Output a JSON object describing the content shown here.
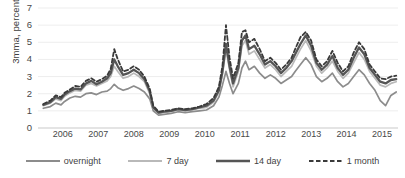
{
  "chart_data": {
    "type": "line",
    "title": "",
    "xlabel": "",
    "ylabel": "3mma, percent",
    "ylim": [
      0,
      7
    ],
    "yticks": [
      0,
      1,
      2,
      3,
      4,
      5,
      6,
      7
    ],
    "xlim": [
      2005.75,
      2015.9
    ],
    "xticks": [
      2006,
      2007,
      2008,
      2009,
      2010,
      2011,
      2012,
      2013,
      2014,
      2015
    ],
    "xtick_labels": [
      "2006",
      "2007",
      "2008",
      "2009",
      "2010",
      "2011",
      "2012",
      "2013",
      "2014",
      "2015"
    ],
    "grid": "horizontal-light",
    "legend_position": "bottom",
    "series": [
      {
        "name": "overnight",
        "color": "#8c8c8c",
        "width": 1.7,
        "dash": "none",
        "x": [
          2005.9,
          2006.1,
          2006.25,
          2006.4,
          2006.5,
          2006.65,
          2006.8,
          2006.95,
          2007.1,
          2007.25,
          2007.4,
          2007.55,
          2007.7,
          2007.8,
          2007.9,
          2008.0,
          2008.15,
          2008.3,
          2008.45,
          2008.6,
          2008.75,
          2008.9,
          2009.0,
          2009.15,
          2009.3,
          2009.5,
          2009.7,
          2009.9,
          2010.1,
          2010.3,
          2010.5,
          2010.7,
          2010.85,
          2010.95,
          2011.05,
          2011.15,
          2011.25,
          2011.4,
          2011.5,
          2011.6,
          2011.7,
          2011.85,
          2012.0,
          2012.15,
          2012.3,
          2012.45,
          2012.6,
          2012.75,
          2012.9,
          2013.0,
          2013.15,
          2013.3,
          2013.45,
          2013.6,
          2013.75,
          2013.9,
          2014.05,
          2014.2,
          2014.35,
          2014.5,
          2014.65,
          2014.8,
          2014.95,
          2015.1,
          2015.25,
          2015.4,
          2015.55,
          2015.7,
          2015.85
        ],
        "values": [
          1.15,
          1.25,
          1.45,
          1.35,
          1.55,
          1.75,
          1.85,
          1.8,
          2.0,
          2.05,
          1.95,
          2.1,
          2.15,
          2.3,
          2.55,
          2.35,
          2.2,
          2.3,
          2.45,
          2.3,
          2.1,
          1.7,
          1.0,
          0.75,
          0.8,
          0.85,
          0.95,
          0.9,
          0.95,
          1.0,
          1.05,
          1.3,
          1.8,
          2.5,
          3.3,
          2.6,
          2.0,
          2.6,
          3.5,
          3.9,
          3.4,
          3.6,
          3.2,
          2.9,
          3.1,
          2.9,
          2.6,
          2.8,
          3.0,
          3.3,
          3.7,
          4.1,
          3.7,
          3.0,
          2.7,
          2.9,
          3.2,
          2.7,
          2.4,
          2.6,
          3.0,
          3.4,
          3.1,
          2.6,
          2.2,
          1.6,
          1.3,
          1.9,
          2.1
        ]
      },
      {
        "name": "7 day",
        "color": "#b9b9b9",
        "width": 1.7,
        "dash": "none",
        "x": [
          2005.9,
          2006.1,
          2006.25,
          2006.4,
          2006.5,
          2006.65,
          2006.8,
          2006.95,
          2007.1,
          2007.25,
          2007.4,
          2007.55,
          2007.7,
          2007.8,
          2007.9,
          2008.0,
          2008.15,
          2008.3,
          2008.45,
          2008.6,
          2008.75,
          2008.9,
          2009.0,
          2009.15,
          2009.3,
          2009.5,
          2009.7,
          2009.9,
          2010.1,
          2010.3,
          2010.5,
          2010.7,
          2010.85,
          2010.95,
          2011.05,
          2011.15,
          2011.25,
          2011.4,
          2011.5,
          2011.6,
          2011.7,
          2011.85,
          2012.0,
          2012.15,
          2012.3,
          2012.45,
          2012.6,
          2012.75,
          2012.9,
          2013.0,
          2013.15,
          2013.3,
          2013.45,
          2013.6,
          2013.75,
          2013.9,
          2014.05,
          2014.2,
          2014.35,
          2014.5,
          2014.65,
          2014.8,
          2014.95,
          2015.1,
          2015.25,
          2015.4,
          2015.55,
          2015.7,
          2015.85
        ],
        "values": [
          1.3,
          1.45,
          1.7,
          1.6,
          1.85,
          2.05,
          2.2,
          2.15,
          2.5,
          2.6,
          2.45,
          2.6,
          2.75,
          3.0,
          3.6,
          3.3,
          2.9,
          3.0,
          3.2,
          3.0,
          2.7,
          2.0,
          1.15,
          0.85,
          0.9,
          0.95,
          1.05,
          1.0,
          1.05,
          1.15,
          1.2,
          1.5,
          2.1,
          3.1,
          4.6,
          3.4,
          2.4,
          3.3,
          4.8,
          5.1,
          4.3,
          4.5,
          4.0,
          3.5,
          3.7,
          3.4,
          3.0,
          3.3,
          3.6,
          4.0,
          4.6,
          5.1,
          4.5,
          3.6,
          3.2,
          3.5,
          3.9,
          3.3,
          2.9,
          3.2,
          3.8,
          4.4,
          4.0,
          3.3,
          2.9,
          2.5,
          2.4,
          2.6,
          2.7
        ]
      },
      {
        "name": "14 day",
        "color": "#555555",
        "width": 2.3,
        "dash": "none",
        "x": [
          2005.9,
          2006.1,
          2006.25,
          2006.4,
          2006.5,
          2006.65,
          2006.8,
          2006.95,
          2007.1,
          2007.25,
          2007.4,
          2007.55,
          2007.7,
          2007.8,
          2007.9,
          2008.0,
          2008.15,
          2008.3,
          2008.45,
          2008.6,
          2008.75,
          2008.9,
          2009.0,
          2009.15,
          2009.3,
          2009.5,
          2009.7,
          2009.9,
          2010.1,
          2010.3,
          2010.5,
          2010.7,
          2010.85,
          2010.95,
          2011.05,
          2011.15,
          2011.25,
          2011.4,
          2011.5,
          2011.6,
          2011.7,
          2011.85,
          2012.0,
          2012.15,
          2012.3,
          2012.45,
          2012.6,
          2012.75,
          2012.9,
          2013.0,
          2013.15,
          2013.3,
          2013.45,
          2013.6,
          2013.75,
          2013.9,
          2014.05,
          2014.2,
          2014.35,
          2014.5,
          2014.65,
          2014.8,
          2014.95,
          2015.1,
          2015.25,
          2015.4,
          2015.55,
          2015.7,
          2015.85
        ],
        "values": [
          1.35,
          1.5,
          1.8,
          1.7,
          1.95,
          2.15,
          2.3,
          2.25,
          2.6,
          2.75,
          2.55,
          2.7,
          2.9,
          3.2,
          4.0,
          3.6,
          3.1,
          3.2,
          3.4,
          3.2,
          2.85,
          2.15,
          1.2,
          0.9,
          0.95,
          1.0,
          1.1,
          1.05,
          1.1,
          1.2,
          1.3,
          1.6,
          2.2,
          3.3,
          4.9,
          3.6,
          2.6,
          3.5,
          5.1,
          5.4,
          4.6,
          4.8,
          4.3,
          3.7,
          3.9,
          3.6,
          3.2,
          3.5,
          3.9,
          4.3,
          4.9,
          5.4,
          4.8,
          3.8,
          3.4,
          3.7,
          4.2,
          3.5,
          3.1,
          3.4,
          4.1,
          4.7,
          4.3,
          3.5,
          3.1,
          2.7,
          2.6,
          2.8,
          2.85
        ]
      },
      {
        "name": "1 month",
        "color": "#3a3a3a",
        "width": 1.8,
        "dash": "4,2.5",
        "x": [
          2005.9,
          2006.1,
          2006.25,
          2006.4,
          2006.5,
          2006.65,
          2006.8,
          2006.95,
          2007.1,
          2007.25,
          2007.4,
          2007.55,
          2007.7,
          2007.8,
          2007.9,
          2008.0,
          2008.15,
          2008.3,
          2008.45,
          2008.6,
          2008.75,
          2008.9,
          2009.0,
          2009.15,
          2009.3,
          2009.5,
          2009.7,
          2009.9,
          2010.1,
          2010.3,
          2010.5,
          2010.7,
          2010.85,
          2010.95,
          2011.05,
          2011.15,
          2011.25,
          2011.4,
          2011.5,
          2011.6,
          2011.7,
          2011.85,
          2012.0,
          2012.15,
          2012.3,
          2012.45,
          2012.6,
          2012.75,
          2012.9,
          2013.0,
          2013.15,
          2013.3,
          2013.45,
          2013.6,
          2013.75,
          2013.9,
          2014.05,
          2014.2,
          2014.35,
          2014.5,
          2014.65,
          2014.8,
          2014.95,
          2015.1,
          2015.25,
          2015.4,
          2015.55,
          2015.7,
          2015.85
        ],
        "values": [
          1.4,
          1.6,
          1.9,
          1.8,
          2.05,
          2.25,
          2.45,
          2.4,
          2.75,
          2.9,
          2.7,
          2.85,
          3.05,
          3.45,
          4.6,
          4.0,
          3.3,
          3.4,
          3.6,
          3.4,
          3.0,
          2.3,
          1.3,
          0.95,
          1.0,
          1.05,
          1.15,
          1.1,
          1.15,
          1.25,
          1.4,
          1.75,
          2.4,
          3.6,
          6.0,
          4.1,
          2.9,
          3.8,
          5.6,
          5.7,
          5.0,
          5.2,
          4.6,
          3.9,
          4.1,
          3.8,
          3.4,
          3.7,
          4.1,
          4.6,
          5.3,
          5.6,
          5.1,
          4.0,
          3.6,
          3.9,
          4.5,
          3.8,
          3.3,
          3.6,
          4.4,
          5.0,
          4.6,
          3.7,
          3.3,
          2.9,
          2.85,
          3.0,
          3.05
        ]
      }
    ]
  },
  "legend": {
    "items": [
      {
        "label": "overnight"
      },
      {
        "label": "7 day"
      },
      {
        "label": "14 day"
      },
      {
        "label": "1 month"
      }
    ]
  }
}
